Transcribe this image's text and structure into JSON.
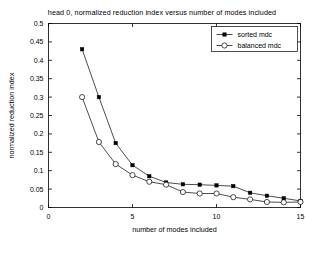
{
  "chart_data": {
    "type": "line",
    "title": "head 0, normalized reduction index versus number of modes included",
    "xlabel": "number of modes included",
    "ylabel": "normalized reduction index",
    "xlim": [
      0,
      15
    ],
    "ylim": [
      0,
      0.5
    ],
    "xticks": [
      0,
      5,
      10,
      15
    ],
    "xtick_labels": [
      "0",
      "5",
      "10",
      "15"
    ],
    "yticks": [
      0,
      0.05,
      0.1,
      0.15,
      0.2,
      0.25,
      0.3,
      0.35,
      0.4,
      0.45,
      0.5
    ],
    "ytick_labels": [
      "0",
      "0.05",
      "0.1",
      "0.15",
      "0.2",
      "0.25",
      "0.3",
      "0.35",
      "0.4",
      "0.45",
      "0.5"
    ],
    "grid": false,
    "legend_position": "upper right",
    "line_color": "#000000",
    "series": [
      {
        "name": "sorted mdc",
        "marker": "filled-square",
        "x": [
          2,
          3,
          4,
          5,
          6,
          7,
          8,
          9,
          10,
          11,
          12,
          13,
          14,
          15
        ],
        "values": [
          0.43,
          0.3,
          0.175,
          0.115,
          0.085,
          0.068,
          0.063,
          0.062,
          0.06,
          0.058,
          0.04,
          0.032,
          0.025,
          0.018
        ]
      },
      {
        "name": "balanced mdc",
        "marker": "open-circle",
        "x": [
          2,
          3,
          4,
          5,
          6,
          7,
          8,
          9,
          10,
          11,
          12,
          13,
          14,
          15
        ],
        "values": [
          0.3,
          0.178,
          0.118,
          0.088,
          0.07,
          0.062,
          0.042,
          0.038,
          0.038,
          0.028,
          0.022,
          0.015,
          0.014,
          0.015
        ]
      }
    ]
  }
}
